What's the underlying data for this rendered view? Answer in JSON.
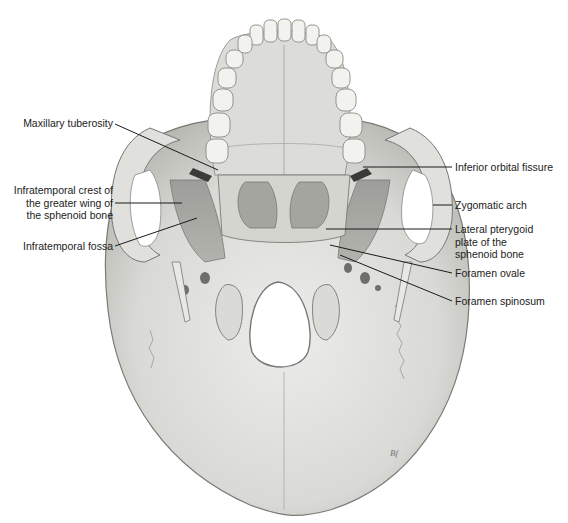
{
  "figure": {
    "signature": "Bf"
  },
  "labels_left": [
    {
      "id": "maxillary-tuberosity",
      "lines": [
        "Maxillary tuberosity"
      ]
    },
    {
      "id": "infratemporal-crest",
      "lines": [
        "Infratemporal crest of",
        "the greater wing of",
        "the sphenoid bone"
      ]
    },
    {
      "id": "infratemporal-fossa",
      "lines": [
        "Infratemporal fossa"
      ]
    }
  ],
  "labels_right": [
    {
      "id": "inferior-orbital-fissure",
      "lines": [
        "Inferior orbital fissure"
      ]
    },
    {
      "id": "zygomatic-arch",
      "lines": [
        "Zygomatic arch"
      ]
    },
    {
      "id": "lateral-pterygoid-plate",
      "lines": [
        "Lateral pterygoid",
        "plate of the",
        "sphenoid bone"
      ]
    },
    {
      "id": "foramen-ovale",
      "lines": [
        "Foramen ovale"
      ]
    },
    {
      "id": "foramen-spinosum",
      "lines": [
        "Foramen spinosum"
      ]
    }
  ],
  "colors": {
    "bone_light": "#e6e6e2",
    "bone_mid": "#c9c9c4",
    "bone_shadow": "#9a9a96",
    "fossa_dark": "#8c8c88",
    "outline": "#6e6e6a",
    "leader": "#1a1a1a",
    "text": "#222222"
  }
}
